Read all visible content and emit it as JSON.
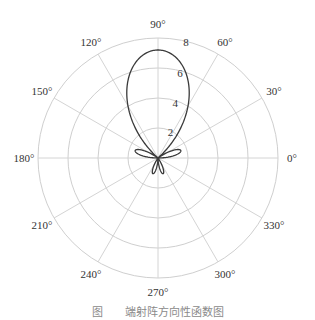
{
  "chart_data": {
    "type": "polar-line",
    "title": "",
    "caption": "图　　端射阵方向性函数图",
    "center_px": [
      158,
      158
    ],
    "outer_radius_px": 120,
    "r_range": [
      0,
      8
    ],
    "r_ticks": [
      2,
      4,
      6,
      8
    ],
    "r_tick_labels": [
      "2",
      "4",
      "6",
      "8"
    ],
    "r_label_angle_deg": 80,
    "angle_ticks_deg": [
      0,
      30,
      60,
      90,
      120,
      150,
      180,
      210,
      240,
      270,
      300,
      330
    ],
    "angle_tick_labels": [
      "0°",
      "30°",
      "60°",
      "90°",
      "120°",
      "150°",
      "180°",
      "210°",
      "240°",
      "270°",
      "300°",
      "330°"
    ],
    "grid": true,
    "series": [
      {
        "name": "pattern",
        "color": "#3a3a3a",
        "lobes": [
          {
            "center_deg": 90,
            "peak": 7.2,
            "half_width_deg": 24
          },
          {
            "center_deg": 18,
            "peak": 1.6,
            "half_width_deg": 9
          },
          {
            "center_deg": 162,
            "peak": 1.6,
            "half_width_deg": 9
          },
          {
            "center_deg": 252,
            "peak": 1.1,
            "half_width_deg": 8
          },
          {
            "center_deg": 288,
            "peak": 1.1,
            "half_width_deg": 8
          }
        ]
      }
    ],
    "colors": {
      "grid": "#cfcfcf",
      "curve": "#3a3a3a",
      "text": "#333333"
    }
  }
}
